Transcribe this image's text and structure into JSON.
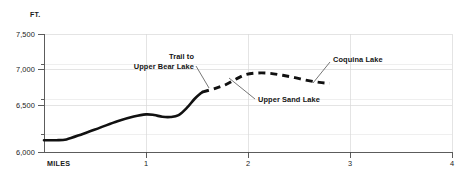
{
  "chart_data": {
    "type": "line",
    "title": "",
    "subtitle": "",
    "xlabel": "MILES",
    "ylabel": "FT.",
    "xlim": [
      0,
      4
    ],
    "ylim": [
      6000,
      7500
    ],
    "grid": true,
    "legend_position": "none",
    "x_ticks": [
      "1",
      "2",
      "3",
      "4"
    ],
    "x_tick_values": [
      1,
      2,
      3,
      4
    ],
    "y_ticks": [
      "6,000",
      "6,500",
      "7,000",
      "7,500"
    ],
    "y_tick_values": [
      6000,
      6500,
      7000,
      7500
    ],
    "y_minor_tick_values": [
      6250,
      6750,
      7250
    ],
    "series": [
      {
        "name": "Trail profile (maintained)",
        "style": "solid",
        "points": [
          [
            0.0,
            6150
          ],
          [
            0.12,
            6150
          ],
          [
            0.22,
            6160
          ],
          [
            0.38,
            6230
          ],
          [
            0.55,
            6310
          ],
          [
            0.72,
            6390
          ],
          [
            0.88,
            6450
          ],
          [
            1.0,
            6478
          ],
          [
            1.08,
            6470
          ],
          [
            1.16,
            6448
          ],
          [
            1.24,
            6445
          ],
          [
            1.32,
            6470
          ],
          [
            1.4,
            6560
          ],
          [
            1.48,
            6680
          ],
          [
            1.55,
            6760
          ]
        ]
      },
      {
        "name": "Trail profile (unmaintained)",
        "style": "dashed",
        "points": [
          [
            1.55,
            6760
          ],
          [
            1.68,
            6810
          ],
          [
            1.78,
            6855
          ],
          [
            1.88,
            6925
          ],
          [
            1.98,
            6985
          ],
          [
            2.1,
            7005
          ],
          [
            2.22,
            7000
          ],
          [
            2.34,
            6975
          ],
          [
            2.46,
            6945
          ],
          [
            2.58,
            6910
          ],
          [
            2.7,
            6885
          ],
          [
            2.8,
            6872
          ]
        ]
      }
    ],
    "annotations": [
      {
        "label_line_1": "Trail to",
        "label_line_2": "Upper Bear Lake",
        "target_x": 1.57,
        "target_y": 6770
      },
      {
        "label_line_1": "Upper Sand Lake",
        "label_line_2": "",
        "target_x": 1.82,
        "target_y": 6845
      },
      {
        "label_line_1": "Coquina Lake",
        "label_line_2": "",
        "target_x": 2.79,
        "target_y": 6875
      }
    ]
  }
}
